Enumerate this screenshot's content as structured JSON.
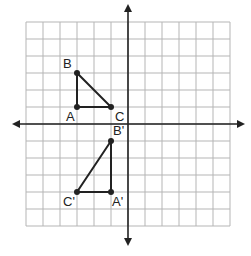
{
  "grid": {
    "x_min": -6,
    "x_max": 6,
    "y_min": -6,
    "y_max": 6,
    "origin_px": [
      128,
      124
    ],
    "cell_px": 17,
    "line_color": "#b5b5b5",
    "axis_color": "#222222"
  },
  "triangles": [
    {
      "name": "ABC",
      "points": [
        {
          "label": "A",
          "x": -3,
          "y": 1,
          "label_dx": -11,
          "label_dy": 14
        },
        {
          "label": "B",
          "x": -3,
          "y": 3,
          "label_dx": -14,
          "label_dy": -5
        },
        {
          "label": "C",
          "x": -1,
          "y": 1,
          "label_dx": 4,
          "label_dy": 14
        }
      ]
    },
    {
      "name": "A'B'C'",
      "points": [
        {
          "label": "A'",
          "x": -1,
          "y": -4,
          "label_dx": 1,
          "label_dy": 14
        },
        {
          "label": "B'",
          "x": -1,
          "y": -1,
          "label_dx": 2,
          "label_dy": -6
        },
        {
          "label": "C'",
          "x": -3,
          "y": -4,
          "label_dx": -14,
          "label_dy": 14
        }
      ]
    }
  ]
}
